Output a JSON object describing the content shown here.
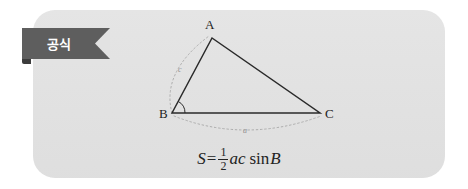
{
  "canvas": {
    "width": 468,
    "height": 189,
    "background": "#ffffff"
  },
  "card": {
    "background": "#e2e2e2",
    "radius": 22
  },
  "ribbon": {
    "label": "공식",
    "background": "#5e5e5e",
    "text_color": "#ffffff",
    "tail_color": "#3c3c3c"
  },
  "figure": {
    "type": "triangle-diagram",
    "stroke_color": "#2a2a2a",
    "dashed_color": "#a9a9a9",
    "label_color": "#1d1d1d",
    "vertices": [
      {
        "name": "A",
        "label": "A",
        "x": 212,
        "y": 38
      },
      {
        "name": "B",
        "label": "B",
        "x": 172,
        "y": 113
      },
      {
        "name": "C",
        "label": "C",
        "x": 320,
        "y": 113
      }
    ],
    "side_labels": [
      {
        "name": "side-c",
        "label": "c",
        "x": 180,
        "y": 72
      },
      {
        "name": "side-a",
        "label": "a",
        "x": 245,
        "y": 131
      }
    ],
    "angle_marks": [
      {
        "name": "angle-B",
        "at": "B"
      }
    ]
  },
  "formula": {
    "lhs": "S",
    "equals": "=",
    "fraction": {
      "numerator": "1",
      "denominator": "2"
    },
    "product": "ac",
    "function": "sin",
    "argument": "B",
    "plain": "S = 1/2 ac sin B"
  }
}
